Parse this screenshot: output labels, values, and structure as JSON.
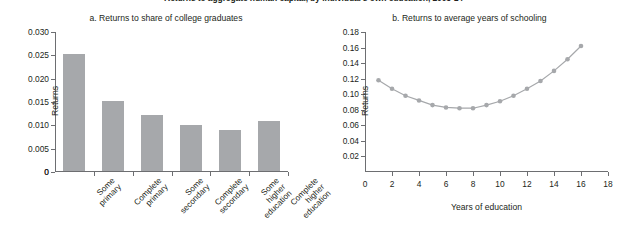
{
  "figure": {
    "main_title": "Returns to aggregate human capital, by individual's own education, 2005-14"
  },
  "panel_a": {
    "title": "a. Returns to share of college graduates",
    "ylabel": "Returns",
    "zero_label": "0",
    "bar_color": "#a6a8ab"
  },
  "panel_b": {
    "title": "b. Returns to average years of schooling",
    "ylabel": "Returns",
    "xlabel": "Years of education",
    "line_color": "#a6a8ab"
  },
  "chart_data": [
    {
      "type": "bar",
      "title": "a. Returns to share of college graduates",
      "xlabel": "",
      "ylabel": "Returns",
      "ylim": [
        0,
        0.03
      ],
      "yticks": [
        0,
        0.005,
        0.01,
        0.015,
        0.02,
        0.025,
        0.03
      ],
      "ytick_labels": [
        "0",
        "0.005",
        "0.010",
        "0.015",
        "0.020",
        "0.025",
        "0.030"
      ],
      "grid": false,
      "legend": "none",
      "categories": [
        "Some primary",
        "Complete primary",
        "Some secondary",
        "Complete secondary",
        "Some higher education",
        "Complete higher education"
      ],
      "values": [
        0.025,
        0.015,
        0.012,
        0.0098,
        0.0088,
        0.0107
      ]
    },
    {
      "type": "line",
      "title": "b. Returns to average years of schooling",
      "xlabel": "Years of education",
      "ylabel": "Returns",
      "xlim": [
        0,
        18
      ],
      "ylim": [
        0,
        0.18
      ],
      "xticks": [
        0,
        2,
        4,
        6,
        8,
        10,
        12,
        14,
        16,
        18
      ],
      "xtick_labels": [
        "0",
        "2",
        "4",
        "6",
        "8",
        "10",
        "12",
        "14",
        "16",
        "18"
      ],
      "yticks": [
        0.02,
        0.04,
        0.06,
        0.08,
        0.1,
        0.12,
        0.14,
        0.16,
        0.18
      ],
      "ytick_labels": [
        "0.02",
        "0.04",
        "0.06",
        "0.08",
        "0.10",
        "0.12",
        "0.14",
        "0.16",
        "0.18"
      ],
      "grid": false,
      "legend": "none",
      "markers": true,
      "x": [
        1,
        2,
        3,
        4,
        5,
        6,
        7,
        8,
        9,
        10,
        11,
        12,
        13,
        14,
        15,
        16
      ],
      "values": [
        0.118,
        0.107,
        0.098,
        0.092,
        0.086,
        0.083,
        0.082,
        0.082,
        0.086,
        0.091,
        0.098,
        0.107,
        0.117,
        0.13,
        0.145,
        0.162
      ]
    }
  ]
}
